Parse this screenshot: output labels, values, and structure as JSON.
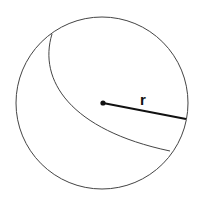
{
  "diagram": {
    "title": "",
    "shape": "sphere",
    "radius_label": "r",
    "colors": {
      "stroke": "#444444",
      "radius": "#111111",
      "background": "#ffffff"
    }
  }
}
